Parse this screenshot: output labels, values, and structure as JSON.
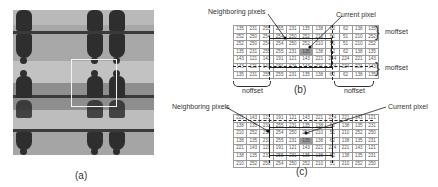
{
  "panel_a": {
    "caption": "(a)",
    "image_desc": "tiled grayscale photo with mirrored figures",
    "selection_box": "current window"
  },
  "panel_b": {
    "caption": "(b)",
    "label_neighbors": "Neighboring pixels",
    "label_current": "Current pixel",
    "label_noffset_right_top": "moffset",
    "label_noffset_right_bottom": "moffset",
    "label_noffset_bottom_left": "noffset",
    "label_noffset_bottom_right": "noffset",
    "rows": [
      [
        "135",
        "231",
        "255",
        "255",
        "231",
        "135",
        "138",
        "62",
        "62",
        "138",
        "135"
      ],
      [
        "252",
        "250",
        "254",
        "254",
        "250",
        "252",
        "210",
        "51",
        "51",
        "210",
        "252"
      ],
      [
        "252",
        "250",
        "254",
        "254",
        "250",
        "252",
        "210",
        "51",
        "51",
        "210",
        "252"
      ],
      [
        "135",
        "231",
        "255",
        "255",
        "231",
        "135",
        "138",
        "62",
        "62",
        "138",
        "135"
      ],
      [
        "143",
        "121",
        "143",
        "191",
        "121",
        "143",
        "221",
        "224",
        "224",
        "221",
        "143"
      ],
      [
        "143",
        "121",
        "143",
        "191",
        "121",
        "143",
        "221",
        "224",
        "224",
        "221",
        "143"
      ],
      [
        "135",
        "231",
        "255",
        "255",
        "231",
        "135",
        "138",
        "62",
        "62",
        "138",
        "135"
      ]
    ],
    "current_cell": [
      3,
      5
    ]
  },
  "panel_c": {
    "caption": "(c)",
    "label_neighbors": "Neighboring pixels",
    "label_current": "Current pixel",
    "rows": [
      [
        "221",
        "143",
        "121",
        "191",
        "121",
        "143",
        "221",
        "224",
        "221",
        "143",
        "121"
      ],
      [
        "138",
        "135",
        "231",
        "255",
        "231",
        "135",
        "138",
        "62",
        "138",
        "135",
        "231"
      ],
      [
        "210",
        "252",
        "250",
        "254",
        "250",
        "252",
        "210",
        "51",
        "210",
        "252",
        "250"
      ],
      [
        "138",
        "135",
        "231",
        "255",
        "231",
        "135",
        "138",
        "62",
        "138",
        "135",
        "231"
      ],
      [
        "221",
        "143",
        "121",
        "191",
        "121",
        "143",
        "221",
        "224",
        "221",
        "143",
        "121"
      ],
      [
        "138",
        "135",
        "231",
        "255",
        "231",
        "135",
        "138",
        "62",
        "138",
        "135",
        "231"
      ],
      [
        "210",
        "252",
        "250",
        "254",
        "250",
        "252",
        "210",
        "51",
        "210",
        "252",
        "250"
      ]
    ],
    "current_cell": [
      3,
      5
    ]
  }
}
